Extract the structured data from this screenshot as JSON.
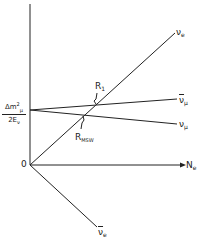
{
  "diagram": {
    "type": "level-crossing diagram",
    "axes": {
      "y_axis_label": {
        "main": "Δm",
        "sup": "2",
        "sub": "μ",
        "denominator": "2E",
        "den_sub": "ν"
      },
      "x_axis_label": {
        "main": "N",
        "sub": "e"
      },
      "origin_label": "0"
    },
    "lines": [
      {
        "name": "nu_e",
        "label": "ν",
        "sub": "e",
        "bar": false
      },
      {
        "name": "nubar_mu",
        "label": "ν",
        "sub": "μ",
        "bar": true
      },
      {
        "name": "nu_mu",
        "label": "ν",
        "sub": "μ",
        "bar": false
      },
      {
        "name": "nubar_e",
        "label": "ν",
        "sub": "e",
        "bar": true
      }
    ],
    "resonances": [
      {
        "name": "R1",
        "label": "R",
        "sub": "1"
      },
      {
        "name": "R_MSW",
        "label": "R",
        "sub": "MSW"
      }
    ],
    "colors": {
      "ink": "#222222",
      "background": "#ffffff"
    }
  }
}
